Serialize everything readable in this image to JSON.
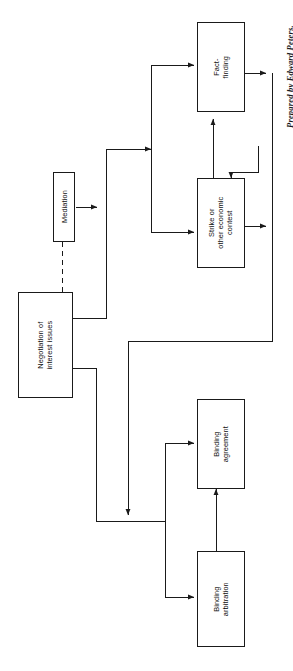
{
  "diagram": {
    "orientation": "rotated-90-ccw",
    "credit": "Prepared by Edward Peters.",
    "stroke_color": "#1a1a1a",
    "background_color": "#ffffff",
    "nodes": [
      {
        "id": "negotiation",
        "label_lines": [
          "Negotiation of",
          "interest issues"
        ]
      },
      {
        "id": "mediation",
        "label_lines": [
          "Mediation"
        ]
      },
      {
        "id": "fact_finding",
        "label_lines": [
          "Fact-",
          "finding"
        ]
      },
      {
        "id": "strike",
        "label_lines": [
          "Strike or",
          "other economic",
          "contest"
        ]
      },
      {
        "id": "binding_agreement",
        "label_lines": [
          "Binding",
          "agreement"
        ]
      },
      {
        "id": "binding_arbitration",
        "label_lines": [
          "Binding",
          "arbitration"
        ]
      }
    ],
    "edges": [
      {
        "from": "negotiation",
        "to": "mediation",
        "style": "dashed"
      },
      {
        "from": "negotiation",
        "to": "fact_finding",
        "style": "solid"
      },
      {
        "from": "negotiation",
        "to": "strike",
        "style": "solid"
      },
      {
        "from": "negotiation",
        "to": "binding_agreement",
        "style": "solid"
      },
      {
        "from": "negotiation",
        "to": "binding_arbitration",
        "style": "solid"
      },
      {
        "from": "strike",
        "to": "fact_finding",
        "style": "solid"
      },
      {
        "from": "fact_finding",
        "to": "strike",
        "style": "solid"
      },
      {
        "from": "fact_finding",
        "to": "negotiation-return",
        "style": "solid"
      },
      {
        "from": "strike",
        "to": "negotiation-return",
        "style": "solid"
      },
      {
        "from": "binding_arbitration",
        "to": "binding_agreement",
        "style": "solid"
      }
    ]
  }
}
